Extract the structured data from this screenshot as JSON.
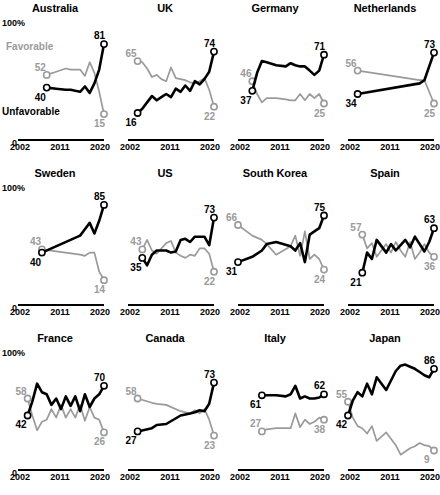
{
  "chart_data": {
    "type": "line",
    "title": "",
    "xlabel": "",
    "ylabel": "",
    "ylim": [
      0,
      100
    ],
    "xlim": [
      2002,
      2020
    ],
    "grid": false,
    "axis_top_label": "100%",
    "axis_zero_label": "0",
    "xticks": [
      "2002",
      "2011",
      "2020"
    ],
    "legend": {
      "position": "inside-first-panel",
      "favorable": "Favorable",
      "unfavorable": "Unfavorable"
    },
    "series_names": [
      "Unfavorable",
      "Favorable"
    ],
    "colors": {
      "unfavorable": "#000000",
      "favorable": "#9a9a9a"
    },
    "panels": [
      {
        "name": "Australia",
        "unfavorable": {
          "start_label": "40",
          "end_label": "81",
          "x": [
            2008,
            2010,
            2012,
            2013,
            2014,
            2015,
            2016,
            2017,
            2018,
            2019,
            2020
          ],
          "y": [
            40,
            39,
            38,
            38,
            37,
            36,
            41,
            35,
            44,
            57,
            81
          ]
        },
        "favorable": {
          "start_label": "52",
          "end_label": "15",
          "x": [
            2008,
            2010,
            2012,
            2013,
            2014,
            2015,
            2016,
            2017,
            2018,
            2019,
            2020
          ],
          "y": [
            52,
            55,
            58,
            57,
            57,
            57,
            51,
            64,
            54,
            36,
            15
          ]
        }
      },
      {
        "name": "UK",
        "unfavorable": {
          "start_label": "16",
          "end_label": "74",
          "x": [
            2004,
            2005,
            2006,
            2007,
            2008,
            2009,
            2010,
            2011,
            2012,
            2013,
            2014,
            2015,
            2016,
            2017,
            2018,
            2019,
            2020
          ],
          "y": [
            16,
            20,
            26,
            32,
            28,
            31,
            34,
            31,
            39,
            36,
            42,
            37,
            46,
            43,
            48,
            55,
            74
          ]
        },
        "favorable": {
          "start_label": "65",
          "end_label": "22",
          "x": [
            2004,
            2005,
            2006,
            2007,
            2008,
            2009,
            2010,
            2011,
            2012,
            2013,
            2014,
            2015,
            2016,
            2017,
            2018,
            2019,
            2020
          ],
          "y": [
            65,
            64,
            58,
            50,
            52,
            48,
            46,
            59,
            49,
            48,
            47,
            45,
            44,
            46,
            49,
            38,
            22
          ]
        }
      },
      {
        "name": "Germany",
        "unfavorable": {
          "start_label": "37",
          "end_label": "71",
          "x": [
            2005,
            2006,
            2007,
            2008,
            2010,
            2012,
            2013,
            2014,
            2015,
            2016,
            2017,
            2018,
            2019,
            2020
          ],
          "y": [
            37,
            54,
            65,
            64,
            61,
            60,
            63,
            61,
            60,
            60,
            56,
            52,
            56,
            71
          ]
        },
        "favorable": {
          "start_label": "46",
          "end_label": "25",
          "x": [
            2005,
            2006,
            2007,
            2008,
            2010,
            2012,
            2013,
            2014,
            2015,
            2016,
            2017,
            2018,
            2019,
            2020
          ],
          "y": [
            46,
            34,
            26,
            30,
            30,
            29,
            28,
            28,
            34,
            28,
            34,
            30,
            34,
            25
          ]
        }
      },
      {
        "name": "Netherlands",
        "unfavorable": {
          "start_label": "34",
          "end_label": "73",
          "x": [
            2004,
            2017,
            2018,
            2020
          ],
          "y": [
            34,
            44,
            47,
            73
          ]
        },
        "favorable": {
          "start_label": "56",
          "end_label": "25",
          "x": [
            2004,
            2017,
            2018,
            2020
          ],
          "y": [
            56,
            47,
            47,
            25
          ]
        }
      },
      {
        "name": "Sweden",
        "unfavorable": {
          "start_label": "40",
          "end_label": "85",
          "x": [
            2007,
            2015,
            2016,
            2017,
            2018,
            2019,
            2020
          ],
          "y": [
            40,
            56,
            62,
            68,
            58,
            70,
            85
          ]
        },
        "favorable": {
          "start_label": "43",
          "end_label": "14",
          "x": [
            2007,
            2015,
            2016,
            2017,
            2018,
            2019,
            2020
          ],
          "y": [
            43,
            38,
            37,
            40,
            40,
            22,
            14
          ]
        }
      },
      {
        "name": "US",
        "unfavorable": {
          "start_label": "35",
          "end_label": "73",
          "x": [
            2005,
            2006,
            2007,
            2008,
            2010,
            2011,
            2012,
            2013,
            2014,
            2015,
            2016,
            2017,
            2018,
            2019,
            2020
          ],
          "y": [
            35,
            28,
            38,
            42,
            42,
            40,
            41,
            52,
            53,
            50,
            55,
            55,
            55,
            47,
            73
          ]
        },
        "favorable": {
          "start_label": "43",
          "end_label": "22",
          "x": [
            2005,
            2006,
            2007,
            2008,
            2010,
            2011,
            2012,
            2013,
            2014,
            2015,
            2016,
            2017,
            2018,
            2019,
            2020
          ],
          "y": [
            43,
            52,
            42,
            39,
            49,
            51,
            40,
            37,
            35,
            38,
            37,
            44,
            44,
            39,
            22
          ]
        }
      },
      {
        "name": "South Korea",
        "unfavorable": {
          "start_label": "31",
          "end_label": "75",
          "x": [
            2002,
            2005,
            2007,
            2008,
            2010,
            2013,
            2014,
            2015,
            2016,
            2017,
            2018,
            2019,
            2020
          ],
          "y": [
            31,
            36,
            42,
            48,
            50,
            46,
            42,
            49,
            31,
            57,
            60,
            63,
            75
          ]
        },
        "favorable": {
          "start_label": "66",
          "end_label": "24",
          "x": [
            2002,
            2005,
            2007,
            2008,
            2010,
            2013,
            2014,
            2015,
            2016,
            2017,
            2018,
            2019,
            2020
          ],
          "y": [
            66,
            56,
            52,
            48,
            38,
            46,
            56,
            37,
            60,
            34,
            38,
            34,
            24
          ]
        }
      },
      {
        "name": "Spain",
        "unfavorable": {
          "start_label": "21",
          "end_label": "63",
          "x": [
            2005,
            2006,
            2007,
            2008,
            2010,
            2011,
            2012,
            2013,
            2014,
            2015,
            2016,
            2017,
            2018,
            2019,
            2020
          ],
          "y": [
            21,
            40,
            34,
            52,
            40,
            48,
            42,
            47,
            52,
            45,
            55,
            48,
            41,
            50,
            63
          ]
        },
        "favorable": {
          "start_label": "57",
          "end_label": "36",
          "x": [
            2005,
            2006,
            2007,
            2008,
            2010,
            2011,
            2012,
            2013,
            2014,
            2015,
            2016,
            2017,
            2018,
            2019,
            2020
          ],
          "y": [
            57,
            44,
            49,
            36,
            48,
            40,
            50,
            42,
            36,
            50,
            34,
            40,
            48,
            40,
            36
          ]
        }
      },
      {
        "name": "France",
        "unfavorable": {
          "start_label": "42",
          "end_label": "70",
          "x": [
            2004,
            2005,
            2006,
            2007,
            2008,
            2009,
            2010,
            2011,
            2012,
            2013,
            2014,
            2015,
            2016,
            2017,
            2018,
            2019,
            2020
          ],
          "y": [
            42,
            55,
            72,
            64,
            62,
            52,
            58,
            48,
            60,
            51,
            60,
            46,
            62,
            50,
            58,
            62,
            70
          ]
        },
        "favorable": {
          "start_label": "58",
          "end_label": "26",
          "x": [
            2004,
            2005,
            2006,
            2007,
            2008,
            2009,
            2010,
            2011,
            2012,
            2013,
            2014,
            2015,
            2016,
            2017,
            2018,
            2019,
            2020
          ],
          "y": [
            58,
            42,
            28,
            36,
            38,
            48,
            40,
            52,
            40,
            48,
            40,
            52,
            37,
            50,
            40,
            38,
            26
          ]
        }
      },
      {
        "name": "Canada",
        "unfavorable": {
          "start_label": "27",
          "end_label": "73",
          "x": [
            2004,
            2007,
            2008,
            2010,
            2013,
            2015,
            2016,
            2017,
            2018,
            2019,
            2020
          ],
          "y": [
            27,
            30,
            33,
            34,
            42,
            44,
            45,
            47,
            46,
            53,
            73
          ]
        },
        "favorable": {
          "start_label": "58",
          "end_label": "23",
          "x": [
            2004,
            2007,
            2008,
            2010,
            2013,
            2015,
            2016,
            2017,
            2018,
            2019,
            2020
          ],
          "y": [
            58,
            54,
            53,
            52,
            46,
            44,
            47,
            44,
            48,
            38,
            23
          ]
        }
      },
      {
        "name": "Italy",
        "unfavorable": {
          "start_label": "61",
          "end_label": "62",
          "x": [
            2007,
            2008,
            2010,
            2012,
            2013,
            2014,
            2015,
            2016,
            2017,
            2018,
            2019,
            2020
          ],
          "y": [
            61,
            61,
            61,
            60,
            62,
            70,
            58,
            60,
            58,
            58,
            59,
            62
          ]
        },
        "favorable": {
          "start_label": "27",
          "end_label": "38",
          "x": [
            2007,
            2008,
            2010,
            2012,
            2013,
            2014,
            2015,
            2016,
            2017,
            2018,
            2019,
            2020
          ],
          "y": [
            27,
            29,
            30,
            30,
            30,
            44,
            31,
            38,
            34,
            36,
            40,
            38
          ]
        }
      },
      {
        "name": "Japan",
        "unfavorable": {
          "start_label": "42",
          "end_label": "86",
          "x": [
            2002,
            2003,
            2004,
            2005,
            2006,
            2007,
            2008,
            2010,
            2012,
            2013,
            2014,
            2015,
            2016,
            2017,
            2018,
            2019,
            2020
          ],
          "y": [
            42,
            56,
            64,
            60,
            72,
            62,
            78,
            66,
            84,
            89,
            90,
            88,
            86,
            83,
            80,
            78,
            86
          ]
        },
        "favorable": {
          "start_label": "55",
          "end_label": "9",
          "x": [
            2002,
            2003,
            2004,
            2005,
            2006,
            2007,
            2008,
            2010,
            2012,
            2013,
            2014,
            2015,
            2016,
            2017,
            2018,
            2019,
            2020
          ],
          "y": [
            55,
            40,
            32,
            30,
            25,
            32,
            18,
            26,
            14,
            5,
            8,
            11,
            13,
            16,
            14,
            13,
            9
          ]
        }
      }
    ]
  }
}
